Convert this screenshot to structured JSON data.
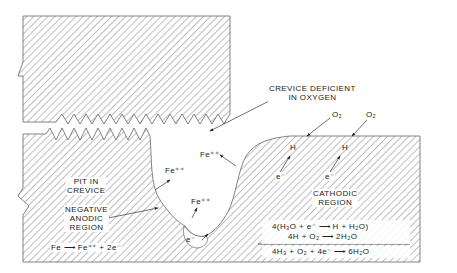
{
  "figure": {
    "colors": {
      "line": "#555555",
      "hatch": "#888888",
      "text": "#222222",
      "background": "#ffffff"
    }
  },
  "labels": {
    "crevice_deficient": [
      "CREVICE DEFICIENT",
      "IN OXYGEN"
    ],
    "o2_left": "O₂",
    "o2_right": "O₂",
    "h_left": "H",
    "h_right": "H",
    "e_left": "e⁻",
    "e_right": "e⁻",
    "fe_upper_right": "Fe⁺⁺",
    "fe_middle_left": "Fe⁺⁺",
    "fe_lower": "Fe⁺⁺",
    "e_pit": "e⁻",
    "pit_in_crevice": [
      "PIT IN",
      "CREVICE"
    ],
    "negative_anodic": [
      "NEGATIVE",
      "ANODIC",
      "REGION"
    ],
    "cathodic_region": [
      "CATHODIC",
      "REGION"
    ],
    "anodic_reaction": "Fe ⟶ Fe⁺⁺ + 2e⁻"
  },
  "equations": {
    "line1": "4(H₃O  +  e⁻ ⟶ H  + H₂O)",
    "line2": "4H  +  O₂ ⟶ 2H₂O",
    "sum": "4H₃ +  O₂  +  4e⁻  ⟶ 6H₂O"
  }
}
